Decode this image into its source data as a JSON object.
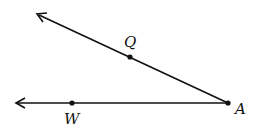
{
  "figure": {
    "type": "angle",
    "vertex": {
      "label": "A",
      "x": 228,
      "y": 103
    },
    "rays": [
      {
        "name": "ray-AQ",
        "through": {
          "label": "Q",
          "x": 130,
          "y": 57
        },
        "arrow_end": {
          "x": 37,
          "y": 14
        }
      },
      {
        "name": "ray-AW",
        "through": {
          "label": "W",
          "x": 72,
          "y": 103
        },
        "arrow_end": {
          "x": 16,
          "y": 103
        }
      }
    ],
    "labels": {
      "A": "A",
      "Q": "Q",
      "W": "W"
    },
    "stroke_color": "#111111"
  }
}
